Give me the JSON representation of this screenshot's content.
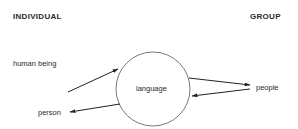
{
  "headers": {
    "left": "INDIVIDUAL",
    "right": "GROUP"
  },
  "nodes": {
    "center": "language",
    "human_being": "human being",
    "person": "person",
    "people": "people"
  },
  "edges": [
    {
      "from": "human being",
      "to": "language"
    },
    {
      "from": "language",
      "to": "person"
    },
    {
      "from": "language",
      "to": "people"
    },
    {
      "from": "people",
      "to": "language"
    }
  ]
}
